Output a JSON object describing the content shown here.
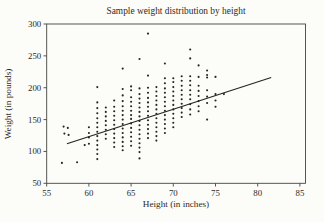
{
  "figure": {
    "title": "Sample weight distribution by height",
    "x_axis_label": "Height (in inches)",
    "y_axis_label": "Weight (in pounds)"
  },
  "colors": {
    "background": "#fcfcf9",
    "frame": "#45433e",
    "marker": "#262420",
    "trend": "#262420",
    "text": "#2e2b26"
  },
  "chart_data": {
    "type": "scatter",
    "title": "Sample weight distribution by height",
    "xlabel": "Height (in inches)",
    "ylabel": "Weight (in pounds)",
    "xlim": [
      55,
      85
    ],
    "ylim": [
      50,
      300
    ],
    "x_ticks": [
      55,
      60,
      65,
      70,
      75,
      80,
      85
    ],
    "y_ticks": [
      50,
      100,
      150,
      200,
      250,
      300
    ],
    "grid": false,
    "legend": "none",
    "marker": {
      "shape": "dot",
      "size": 1.05,
      "color": "#262420"
    },
    "trend_line": {
      "x1": 57.4,
      "y1": 112,
      "x2": 81.6,
      "y2": 216
    },
    "points": [
      [
        56.8,
        82
      ],
      [
        58.6,
        83
      ],
      [
        57,
        139
      ],
      [
        57.5,
        137
      ],
      [
        57.1,
        128
      ],
      [
        57.6,
        126
      ],
      [
        59.5,
        110
      ],
      [
        60,
        138
      ],
      [
        60,
        129
      ],
      [
        60,
        122
      ],
      [
        60,
        112
      ],
      [
        61,
        201
      ],
      [
        61,
        177
      ],
      [
        61,
        168
      ],
      [
        61,
        160
      ],
      [
        61,
        152
      ],
      [
        61,
        145
      ],
      [
        61,
        138
      ],
      [
        61,
        131
      ],
      [
        61,
        124
      ],
      [
        61,
        117
      ],
      [
        61,
        110
      ],
      [
        61,
        103
      ],
      [
        61,
        96
      ],
      [
        61,
        88
      ],
      [
        62,
        169
      ],
      [
        62,
        162
      ],
      [
        62,
        155
      ],
      [
        62,
        148
      ],
      [
        62,
        141
      ],
      [
        62,
        134
      ],
      [
        62,
        127
      ],
      [
        62,
        120
      ],
      [
        63,
        180
      ],
      [
        63,
        170
      ],
      [
        63,
        163
      ],
      [
        63,
        156
      ],
      [
        63,
        149
      ],
      [
        63,
        142
      ],
      [
        63,
        135
      ],
      [
        63,
        128
      ],
      [
        63,
        121
      ],
      [
        63,
        114
      ],
      [
        63,
        107
      ],
      [
        64,
        230
      ],
      [
        64,
        198
      ],
      [
        64,
        188
      ],
      [
        64,
        179
      ],
      [
        64,
        171
      ],
      [
        64,
        164
      ],
      [
        64,
        157
      ],
      [
        64,
        150
      ],
      [
        64,
        143
      ],
      [
        64,
        136
      ],
      [
        64,
        129
      ],
      [
        64,
        122
      ],
      [
        64,
        115
      ],
      [
        64,
        108
      ],
      [
        64,
        102
      ],
      [
        65,
        202
      ],
      [
        65,
        196
      ],
      [
        65,
        185
      ],
      [
        65,
        178
      ],
      [
        65,
        171
      ],
      [
        65,
        164
      ],
      [
        65,
        157
      ],
      [
        65,
        151
      ],
      [
        65,
        144
      ],
      [
        65,
        137
      ],
      [
        65,
        130
      ],
      [
        65,
        123
      ],
      [
        65,
        116
      ],
      [
        65,
        109
      ],
      [
        66,
        245
      ],
      [
        66,
        199
      ],
      [
        66,
        190
      ],
      [
        66,
        183
      ],
      [
        66,
        176
      ],
      [
        66,
        169
      ],
      [
        66,
        162
      ],
      [
        66,
        155
      ],
      [
        66,
        148
      ],
      [
        66,
        141
      ],
      [
        66,
        134
      ],
      [
        66,
        127
      ],
      [
        66,
        120
      ],
      [
        66,
        113
      ],
      [
        66,
        106
      ],
      [
        66,
        99
      ],
      [
        66,
        89
      ],
      [
        67,
        285
      ],
      [
        67,
        219
      ],
      [
        67,
        200
      ],
      [
        67,
        192
      ],
      [
        67,
        184
      ],
      [
        67,
        177
      ],
      [
        67,
        170
      ],
      [
        67,
        163
      ],
      [
        67,
        156
      ],
      [
        67,
        149
      ],
      [
        67,
        142
      ],
      [
        67,
        135
      ],
      [
        67,
        128
      ],
      [
        67,
        121
      ],
      [
        68,
        201
      ],
      [
        68,
        194
      ],
      [
        68,
        187
      ],
      [
        68,
        180
      ],
      [
        68,
        173
      ],
      [
        68,
        166
      ],
      [
        68,
        159
      ],
      [
        68,
        152
      ],
      [
        68,
        145
      ],
      [
        68,
        138
      ],
      [
        68,
        131
      ],
      [
        68,
        124
      ],
      [
        68,
        117
      ],
      [
        69,
        238
      ],
      [
        69,
        215
      ],
      [
        69,
        207
      ],
      [
        69,
        199
      ],
      [
        69,
        192
      ],
      [
        69,
        185
      ],
      [
        69,
        178
      ],
      [
        69,
        171
      ],
      [
        69,
        164
      ],
      [
        69,
        157
      ],
      [
        69,
        150
      ],
      [
        69,
        143
      ],
      [
        69,
        136
      ],
      [
        69,
        129
      ],
      [
        70,
        215
      ],
      [
        70,
        209
      ],
      [
        70,
        201
      ],
      [
        70,
        194
      ],
      [
        70,
        187
      ],
      [
        70,
        180
      ],
      [
        70,
        173
      ],
      [
        70,
        166
      ],
      [
        70,
        159
      ],
      [
        70,
        152
      ],
      [
        70,
        145
      ],
      [
        70,
        138
      ],
      [
        71,
        218
      ],
      [
        71,
        211
      ],
      [
        71,
        203
      ],
      [
        71,
        196
      ],
      [
        71,
        189
      ],
      [
        71,
        182
      ],
      [
        71,
        175
      ],
      [
        71,
        168
      ],
      [
        71,
        161
      ],
      [
        71,
        154
      ],
      [
        72,
        260
      ],
      [
        72,
        246
      ],
      [
        72,
        218
      ],
      [
        72,
        211
      ],
      [
        72,
        204
      ],
      [
        72,
        196
      ],
      [
        72,
        189
      ],
      [
        72,
        182
      ],
      [
        72,
        174
      ],
      [
        72,
        166
      ],
      [
        72,
        158
      ],
      [
        73,
        235
      ],
      [
        73,
        217
      ],
      [
        73,
        203
      ],
      [
        73,
        195
      ],
      [
        73,
        187
      ],
      [
        73,
        179
      ],
      [
        73,
        171
      ],
      [
        73,
        163
      ],
      [
        74,
        227
      ],
      [
        74,
        220
      ],
      [
        74,
        216
      ],
      [
        74,
        196
      ],
      [
        74,
        186
      ],
      [
        74,
        176
      ],
      [
        74,
        150
      ],
      [
        75,
        217
      ],
      [
        75,
        190
      ],
      [
        75,
        180
      ],
      [
        75,
        170
      ],
      [
        76,
        190
      ]
    ]
  }
}
